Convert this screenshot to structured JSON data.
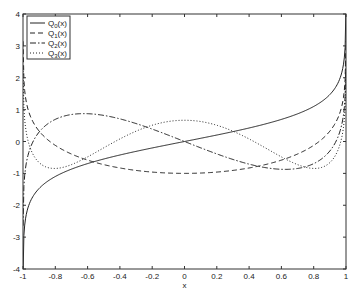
{
  "chart_data": {
    "type": "line",
    "title": "",
    "xlabel": "x",
    "ylabel": "",
    "xlim": [
      -1,
      1
    ],
    "ylim": [
      -4,
      4
    ],
    "grid": false,
    "legend_position": "top-left",
    "x_ticks": [
      -1,
      -0.8,
      -0.6,
      -0.4,
      -0.2,
      0,
      0.2,
      0.4,
      0.6,
      0.8,
      1
    ],
    "x_tick_labels": [
      "-1",
      "-0.8",
      "-0.6",
      "-0.4",
      "-0.2",
      "0",
      "0.2",
      "0.4",
      "0.6",
      "0.8",
      "1"
    ],
    "y_ticks": [
      -4,
      -3,
      -2,
      -1,
      0,
      1,
      2,
      3,
      4
    ],
    "y_tick_labels": [
      "-4",
      "-3",
      "-2",
      "-1",
      "0",
      "1",
      "2",
      "3",
      "4"
    ],
    "series": [
      {
        "name": "Q0(x)",
        "base": "Q",
        "sub": "0",
        "style": "solid",
        "x": [
          -0.999,
          -0.99,
          -0.95,
          -0.9,
          -0.8,
          -0.7,
          -0.6,
          -0.5,
          -0.4,
          -0.3,
          -0.2,
          -0.1,
          0,
          0.1,
          0.2,
          0.3,
          0.4,
          0.5,
          0.6,
          0.7,
          0.8,
          0.9,
          0.95,
          0.99,
          0.999
        ],
        "y": [
          -3.8,
          -2.647,
          -1.832,
          -1.472,
          -1.099,
          -0.867,
          -0.693,
          -0.549,
          -0.424,
          -0.31,
          -0.203,
          -0.1,
          0,
          0.1,
          0.203,
          0.31,
          0.424,
          0.549,
          0.693,
          0.867,
          1.099,
          1.472,
          1.832,
          2.647,
          3.8
        ]
      },
      {
        "name": "Q1(x)",
        "base": "Q",
        "sub": "1",
        "style": "dashed",
        "x": [
          -0.999,
          -0.99,
          -0.95,
          -0.9,
          -0.8,
          -0.7,
          -0.6,
          -0.5,
          -0.4,
          -0.3,
          -0.2,
          -0.1,
          0,
          0.1,
          0.2,
          0.3,
          0.4,
          0.5,
          0.6,
          0.7,
          0.8,
          0.9,
          0.95,
          0.99,
          0.999
        ],
        "y": [
          2.796,
          1.621,
          0.74,
          0.325,
          -0.121,
          -0.393,
          -0.584,
          -0.725,
          -0.83,
          -0.907,
          -0.959,
          -0.99,
          -1,
          -0.99,
          -0.959,
          -0.907,
          -0.83,
          -0.725,
          -0.584,
          -0.393,
          -0.121,
          0.325,
          0.74,
          1.621,
          2.796
        ]
      },
      {
        "name": "Q2(x)",
        "base": "Q",
        "sub": "2",
        "style": "dashdot",
        "x": [
          -0.999,
          -0.99,
          -0.95,
          -0.9,
          -0.8,
          -0.7,
          -0.6,
          -0.5,
          -0.4,
          -0.3,
          -0.2,
          -0.1,
          0,
          0.1,
          0.2,
          0.3,
          0.4,
          0.5,
          0.6,
          0.7,
          0.8,
          0.9,
          0.95,
          0.99,
          0.999
        ],
        "y": [
          -2.3,
          -0.965,
          -0.276,
          0.035,
          0.595,
          0.814,
          0.872,
          0.818,
          0.693,
          0.521,
          0.32,
          0.102,
          0,
          -0.102,
          -0.32,
          -0.521,
          -0.693,
          -0.818,
          -0.872,
          -0.814,
          -0.595,
          -0.035,
          0.276,
          0.965,
          2.3
        ]
      },
      {
        "name": "Q3(x)",
        "base": "Q",
        "sub": "3",
        "style": "dotted",
        "x": [
          -0.999,
          -0.99,
          -0.95,
          -0.9,
          -0.8,
          -0.7,
          -0.6,
          -0.5,
          -0.4,
          -0.3,
          -0.2,
          -0.1,
          0,
          0.1,
          0.2,
          0.3,
          0.4,
          0.5,
          0.6,
          0.7,
          0.8,
          0.9,
          0.95,
          0.99,
          0.999
        ],
        "y": [
          1.8,
          0.554,
          -0.234,
          -0.451,
          -0.614,
          -0.487,
          -0.241,
          0.02,
          0.262,
          0.457,
          0.59,
          0.655,
          0.667,
          0.655,
          0.59,
          0.457,
          0.262,
          0.02,
          -0.241,
          -0.487,
          -0.614,
          -0.451,
          -0.234,
          0.554,
          1.8
        ]
      }
    ]
  }
}
